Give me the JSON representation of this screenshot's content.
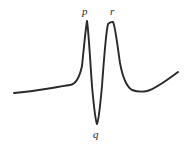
{
  "figure": {
    "background_color": "#ffffff",
    "line_color": "#2a2a2a",
    "line_width": 1.9,
    "width": 189,
    "height": 150
  },
  "labels": {
    "p": "p",
    "q": "q",
    "r": "r"
  },
  "chart_data": {
    "type": "line",
    "title": "",
    "subtitle": "",
    "xlabel": "",
    "ylabel": "",
    "grid": false,
    "legend": null,
    "axes_visible": false,
    "xlim": [
      14,
      179
    ],
    "ylim": [
      150,
      0
    ],
    "annotations": [
      {
        "text": "p",
        "x": 87,
        "y": 21,
        "label_x": 86,
        "label_y": 12,
        "style": "italic-serif",
        "feature": "first-positive-peak"
      },
      {
        "text": "q",
        "x": 97,
        "y": 124,
        "label_x": 97,
        "label_y": 134,
        "style": "italic-serif",
        "feature": "negative-trough"
      },
      {
        "text": "r",
        "x": 113,
        "y": 22,
        "label_x": 113,
        "label_y": 12,
        "style": "italic-serif",
        "feature": "second-positive-peak"
      }
    ],
    "series": [
      {
        "name": "spectrum",
        "color": "#2a2a2a",
        "path": "M 14,93 C 28,92 40,90 52,88 C 60,86.5 66,85.5 70,85 C 75,84.4 79,80 82,66 C 84,47 85.5,30 87,21 C 88.5,30 90,58 92,86 C 94,108 95.5,121 97,124 C 98.5,121 100,108 102,86 C 104,58 106,32 108,24 C 110,22.4 111.5,21.6 113,22 C 115,25 117,42 120,63 C 123,79 127,87 132,90 C 137,91.8 142,92 147,91 C 155,89 166,81 178,72",
        "points": [
          {
            "x": 14,
            "y": 93,
            "feature": "left-endpoint"
          },
          {
            "x": 52,
            "y": 88,
            "feature": "left-baseline"
          },
          {
            "x": 70,
            "y": 85,
            "feature": "left-shoulder"
          },
          {
            "x": 87,
            "y": 21,
            "feature": "peak-p"
          },
          {
            "x": 97,
            "y": 124,
            "feature": "trough-q"
          },
          {
            "x": 113,
            "y": 22,
            "feature": "peak-r"
          },
          {
            "x": 142,
            "y": 92,
            "feature": "right-shoulder-minimum"
          },
          {
            "x": 178,
            "y": 72,
            "feature": "right-endpoint"
          }
        ]
      }
    ]
  }
}
